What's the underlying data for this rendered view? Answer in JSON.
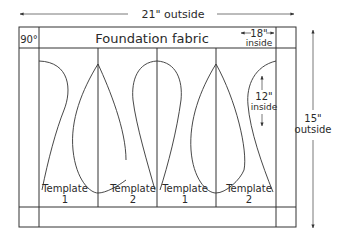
{
  "diagram": {
    "dimensions": {
      "outside_width": "21\" outside",
      "outside_height_value": "15\"",
      "outside_height_word": "outside",
      "inside_width_value": "18\"",
      "inside_width_word": "inside",
      "inside_height_value": "12\"",
      "inside_height_word": "inside"
    },
    "corner_label": "90°",
    "header_label": "Foundation fabric",
    "templates": [
      {
        "word": "Template",
        "number": "1"
      },
      {
        "word": "Template",
        "number": "2"
      },
      {
        "word": "Template",
        "number": "1"
      },
      {
        "word": "Template",
        "number": "2"
      }
    ]
  }
}
